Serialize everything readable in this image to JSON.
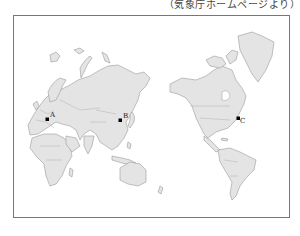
{
  "caption": "（気象庁ホームページより）",
  "map": {
    "projection": "pacific-centered world map",
    "land_color": "#e4e4e4",
    "outline_color": "#9a9a9a",
    "markers": [
      {
        "id": "A",
        "label": "A",
        "x": 47,
        "y": 119,
        "region": "Europe"
      },
      {
        "id": "B",
        "label": "B",
        "x": 120,
        "y": 120,
        "region": "East Asia"
      },
      {
        "id": "C",
        "label": "C",
        "x": 238,
        "y": 118,
        "region": "North America (east coast)"
      }
    ]
  }
}
